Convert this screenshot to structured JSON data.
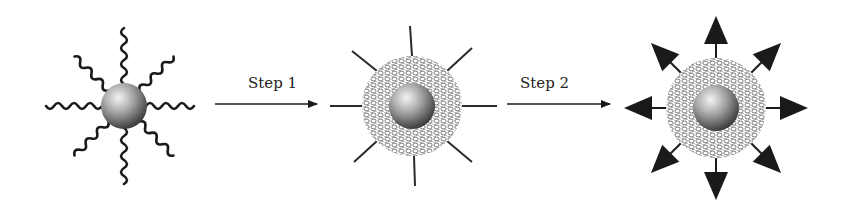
{
  "diagram": {
    "colors": {
      "ink": "#1a1a1a",
      "sphere_light": "#f2f2f2",
      "sphere_mid": "#9a9a9a",
      "sphere_dark": "#3c3c3c",
      "mesh": "#777777"
    },
    "stages": [
      {
        "id": "stage-1",
        "name": "particle-with-polymer-chains",
        "cx": 124,
        "cy": 106,
        "core_r": 23,
        "features": "8 wavy ligand chains"
      },
      {
        "id": "stage-2",
        "name": "particle-with-mesh-shell-and-spokes",
        "cx": 412,
        "cy": 106,
        "core_r": 23,
        "shell_r": 50,
        "features": "crosslinked shell, 8 straight spokes"
      },
      {
        "id": "stage-3",
        "name": "particle-with-mesh-shell-and-arrows",
        "cx": 716,
        "cy": 108,
        "core_r": 23,
        "shell_r": 50,
        "features": "crosslinked shell, 8 outward arrows"
      }
    ],
    "steps": [
      {
        "label": "Step 1",
        "x1": 215,
        "x2": 317,
        "y": 104
      },
      {
        "label": "Step 2",
        "x1": 507,
        "x2": 610,
        "y": 104
      }
    ]
  }
}
